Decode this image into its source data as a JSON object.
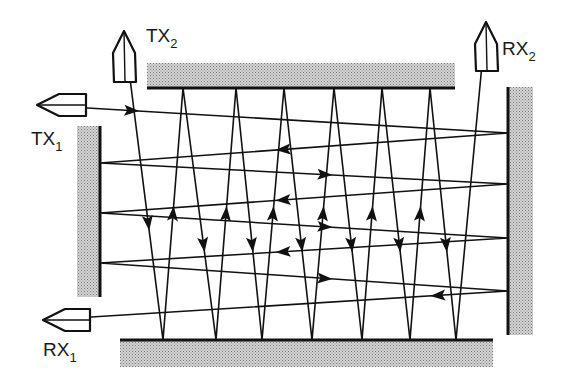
{
  "diagram": {
    "type": "multipath-reflection",
    "colors": {
      "ink": "#111111",
      "wall_fill": "#bdbdbd",
      "background": "#ffffff"
    },
    "labels": {
      "tx1": {
        "main": "TX",
        "sub": "1"
      },
      "tx2": {
        "main": "TX",
        "sub": "2"
      },
      "rx1": {
        "main": "RX",
        "sub": "1"
      },
      "rx2": {
        "main": "RX",
        "sub": "2"
      }
    },
    "walls": [
      {
        "id": "top",
        "x": 147,
        "y": 63,
        "w": 308,
        "h": 25,
        "edge": "bottom"
      },
      {
        "id": "left",
        "x": 77,
        "y": 126,
        "w": 23,
        "h": 171,
        "edge": "right"
      },
      {
        "id": "right",
        "x": 508,
        "y": 87,
        "w": 25,
        "h": 248,
        "edge": "left"
      },
      {
        "id": "bottom",
        "x": 120,
        "y": 340,
        "w": 373,
        "h": 27,
        "edge": "top"
      }
    ],
    "transducers": [
      {
        "id": "tx1",
        "role": "transmitter",
        "direction": "left",
        "tip": [
          37,
          105
        ],
        "back": 86,
        "half": 11
      },
      {
        "id": "tx2",
        "role": "transmitter",
        "direction": "up",
        "tip": [
          124,
          31
        ],
        "back": 82,
        "half": 11
      },
      {
        "id": "rx2",
        "role": "receiver",
        "direction": "up",
        "tip": [
          486,
          22
        ],
        "back": 71,
        "half": 11
      },
      {
        "id": "rx1",
        "role": "receiver",
        "direction": "left",
        "tip": [
          43,
          320
        ],
        "back": 90,
        "half": 11
      }
    ],
    "paths": [
      {
        "id": "horizontal-path",
        "from": "TX1",
        "to": "RX1",
        "points": [
          [
            37,
            105
          ],
          [
            508,
            133
          ],
          [
            100,
            163
          ],
          [
            508,
            184
          ],
          [
            100,
            213
          ],
          [
            508,
            238
          ],
          [
            100,
            263
          ],
          [
            508,
            291
          ],
          [
            43,
            320
          ]
        ]
      },
      {
        "id": "vertical-path",
        "from": "TX2",
        "to": "RX2",
        "points": [
          [
            124,
            31
          ],
          [
            163,
            340
          ],
          [
            183,
            88
          ],
          [
            216,
            340
          ],
          [
            236,
            88
          ],
          [
            262,
            340
          ],
          [
            284,
            88
          ],
          [
            312,
            340
          ],
          [
            334,
            88
          ],
          [
            362,
            340
          ],
          [
            382,
            88
          ],
          [
            410,
            340
          ],
          [
            430,
            88
          ],
          [
            456,
            340
          ],
          [
            486,
            22
          ]
        ]
      }
    ]
  }
}
